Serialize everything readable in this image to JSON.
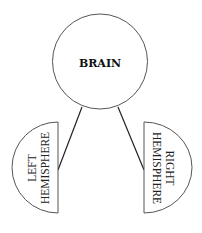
{
  "diagram": {
    "type": "hierarchy",
    "root": {
      "label": "BRAIN",
      "shape": "circle"
    },
    "children": [
      {
        "side": "left",
        "shape": "half-circle",
        "lines": [
          "LEFT",
          "HEMISPHERE"
        ]
      },
      {
        "side": "right",
        "shape": "half-circle",
        "lines": [
          "RIGHT",
          "HEMISPHERE"
        ]
      }
    ],
    "edges": [
      {
        "from": "BRAIN",
        "to": "LEFT HEMISPHERE"
      },
      {
        "from": "BRAIN",
        "to": "RIGHT HEMISPHERE"
      }
    ]
  },
  "colors": {
    "background": "#ffffff",
    "stroke": "#555555",
    "text": "#111111"
  }
}
